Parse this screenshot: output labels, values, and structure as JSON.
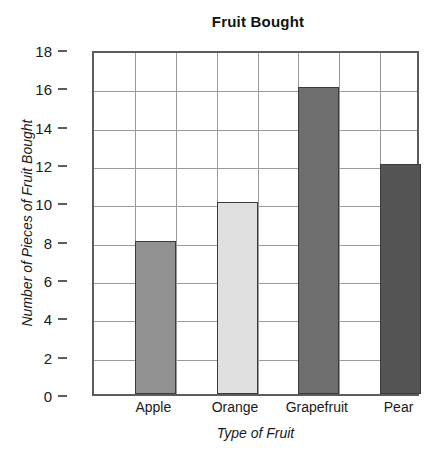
{
  "chart_data": {
    "type": "bar",
    "title": "Fruit Bought",
    "xlabel": "Type of Fruit",
    "ylabel": "Number of Pieces of Fruit Bought",
    "categories": [
      "Apple",
      "Orange",
      "Grapefruit",
      "Pear"
    ],
    "values": [
      8,
      10,
      16,
      12
    ],
    "bar_colors": [
      "#919191",
      "#e0e0e0",
      "#6e6e6e",
      "#545454"
    ],
    "bar_edge_color": "#3a3a3a",
    "ylim": [
      0,
      18
    ],
    "ytick_labels": [
      "0",
      "2",
      "4",
      "6",
      "8",
      "10",
      "12",
      "14",
      "16",
      "18"
    ],
    "ytick_values": [
      0,
      2,
      4,
      6,
      8,
      10,
      12,
      14,
      16,
      18
    ],
    "y_tick_step": 2,
    "grid": true,
    "grid_color": "#9a9a9a",
    "grid_columns": 8,
    "axis_color": "#5d5d5d",
    "legend": null,
    "background": "#ffffff"
  }
}
